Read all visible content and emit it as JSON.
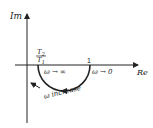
{
  "diagram": {
    "type": "polar-plot",
    "axes": {
      "vertical_label": "Im",
      "horizontal_label": "Re"
    },
    "points": {
      "left_intercept_num": "T",
      "left_intercept_num_sub": "2",
      "left_intercept_den": "T",
      "left_intercept_den_sub": "1",
      "right_intercept": "1"
    },
    "annotations": {
      "omega_inf": "ω → ∞",
      "omega_zero": "ω → 0",
      "omega_increase": "ω increase"
    },
    "colors": {
      "stroke": "#222222",
      "background": "#ffffff"
    }
  }
}
